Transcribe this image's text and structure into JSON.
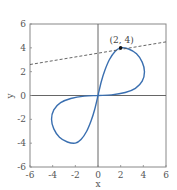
{
  "chart_data": {
    "type": "line",
    "title": "",
    "xlabel": "x",
    "ylabel": "y",
    "xlim": [
      -6,
      6
    ],
    "ylim": [
      -6,
      6
    ],
    "grid": false,
    "x_ticks": [
      -6,
      -4,
      -2,
      0,
      2,
      4,
      6
    ],
    "y_ticks": [
      -6,
      -4,
      -2,
      0,
      2,
      4,
      6
    ],
    "x_tick_labels": [
      "-6",
      "-4",
      "-2",
      "0",
      "2",
      "4",
      "6"
    ],
    "y_tick_labels": [
      "-6",
      "-4",
      "-2",
      "0",
      "2",
      "4",
      "6"
    ],
    "series": [
      {
        "name": "figure-eight curve",
        "style": "solid",
        "color": "#3a6fb0",
        "points": [
          [
            0,
            0
          ],
          [
            0.3,
            1.2
          ],
          [
            0.6,
            2.1
          ],
          [
            1.0,
            3.0
          ],
          [
            1.5,
            3.7
          ],
          [
            2,
            4
          ],
          [
            2.7,
            3.9
          ],
          [
            3.4,
            3.5
          ],
          [
            3.9,
            2.8
          ],
          [
            4.1,
            2.0
          ],
          [
            3.9,
            1.2
          ],
          [
            3.3,
            0.6
          ],
          [
            2.4,
            0.25
          ],
          [
            1.2,
            0.05
          ],
          [
            0,
            0
          ],
          [
            -1.2,
            -0.05
          ],
          [
            -2.4,
            -0.25
          ],
          [
            -3.3,
            -0.6
          ],
          [
            -3.9,
            -1.2
          ],
          [
            -4.1,
            -2.0
          ],
          [
            -3.9,
            -2.8
          ],
          [
            -3.4,
            -3.5
          ],
          [
            -2.7,
            -3.9
          ],
          [
            -2,
            -4
          ],
          [
            -1.5,
            -3.7
          ],
          [
            -1.0,
            -3.0
          ],
          [
            -0.6,
            -2.1
          ],
          [
            -0.3,
            -1.2
          ],
          [
            0,
            0
          ]
        ]
      },
      {
        "name": "tangent line at (2, 4)",
        "style": "dashed",
        "color": "#555555",
        "points": [
          [
            -6,
            2.6
          ],
          [
            6,
            4.5
          ]
        ]
      }
    ],
    "annotations": [
      {
        "text": "(2, 4)",
        "x": 2,
        "y": 4,
        "marker": "filled-dot",
        "color": "#111111"
      }
    ]
  }
}
